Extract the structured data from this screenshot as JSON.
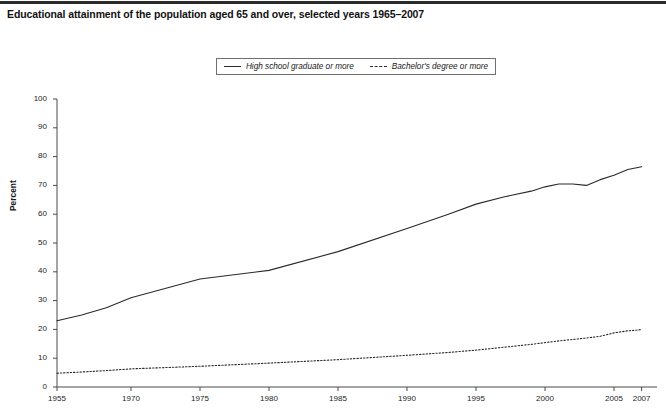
{
  "figure": {
    "title": "Educational attainment of the population aged 65 and over, selected years 1965–2007"
  },
  "legend": {
    "entries": [
      {
        "label": "High school graduate or more",
        "style": "solid",
        "marker": "solid-line-swatch"
      },
      {
        "label": "Bachelor's degree or more",
        "style": "dashed",
        "marker": "dashed-line-swatch"
      }
    ]
  },
  "axes": {
    "y_label": "Percent",
    "y_ticks": [
      "0",
      "10",
      "20",
      "30",
      "40",
      "50",
      "60",
      "70",
      "80",
      "90",
      "100"
    ],
    "x_ticks": [
      "1955",
      "1970",
      "1975",
      "1980",
      "1985",
      "1990",
      "1995",
      "2000",
      "2005",
      "2007"
    ]
  },
  "colors": {
    "line": "#2a2a2a",
    "axis": "#4a4a4a",
    "title": "#121212",
    "background": "#ffffff"
  },
  "chart_data": {
    "type": "line",
    "title": "Educational attainment of the population aged 65 and over, selected years 1965–2007",
    "xlabel": "",
    "ylabel": "Percent",
    "xlim": [
      1955,
      2007
    ],
    "ylim": [
      0,
      100
    ],
    "grid": false,
    "legend_position": "top-center",
    "x_tick_values": [
      1955,
      1970,
      1975,
      1980,
      1985,
      1990,
      1995,
      2000,
      2005,
      2007
    ],
    "y_tick_values": [
      0,
      10,
      20,
      30,
      40,
      50,
      60,
      70,
      80,
      90,
      100
    ],
    "x": [
      1955,
      1960,
      1965,
      1970,
      1975,
      1980,
      1985,
      1990,
      1993,
      1995,
      1997,
      1999,
      2000,
      2001,
      2002,
      2003,
      2004,
      2005,
      2006,
      2007
    ],
    "series": [
      {
        "name": "High school graduate or more",
        "style": "solid",
        "values": [
          23.0,
          25.0,
          27.5,
          31.0,
          37.5,
          40.5,
          47.0,
          55.0,
          60.0,
          63.5,
          66.0,
          68.0,
          69.5,
          70.5,
          70.5,
          70.0,
          72.0,
          73.5,
          75.5,
          76.5
        ]
      },
      {
        "name": "Bachelor's degree or more",
        "style": "dashed",
        "values": [
          4.8,
          5.2,
          5.7,
          6.3,
          7.2,
          8.3,
          9.5,
          11.0,
          12.0,
          12.8,
          13.8,
          14.8,
          15.4,
          16.0,
          16.5,
          17.0,
          17.6,
          18.8,
          19.5,
          19.9
        ]
      }
    ]
  },
  "footnote": {
    "text": ""
  }
}
